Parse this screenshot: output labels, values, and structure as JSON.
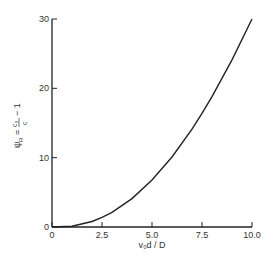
{
  "chart_data": {
    "type": "line",
    "title": "",
    "xlabel": "v₀d / D",
    "ylabel": "ψ_R = c₀/c − 1",
    "xlim": [
      0,
      10
    ],
    "ylim": [
      0,
      30
    ],
    "x_ticks": [
      "0",
      "2.5",
      "5.0",
      "7.5",
      "10.0"
    ],
    "y_ticks": [
      "0",
      "10",
      "20",
      "30"
    ],
    "grid": false,
    "legend": null,
    "series": [
      {
        "name": "psi_R",
        "x": [
          0,
          1,
          2,
          2.5,
          3,
          4,
          5,
          6,
          7,
          7.5,
          8,
          9,
          10
        ],
        "y": [
          0,
          0.1,
          0.8,
          1.4,
          2.1,
          4.1,
          6.8,
          10.1,
          14.1,
          16.4,
          18.8,
          24.1,
          30.0
        ]
      }
    ]
  },
  "labels": {
    "x_axis": "v₀d / D",
    "y_axis_psi": "ψ",
    "y_axis_sub": "R",
    "y_axis_eq": "=",
    "y_axis_num": "c₀",
    "y_axis_den": "c",
    "y_axis_minus": "− 1"
  }
}
